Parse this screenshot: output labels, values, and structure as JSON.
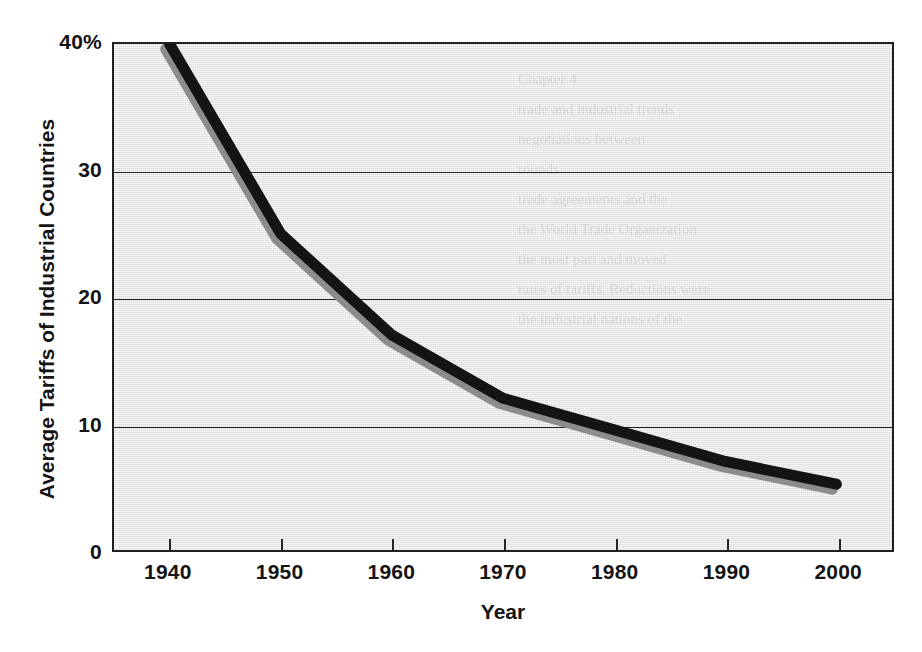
{
  "figure": {
    "background_color": "#ffffff",
    "plot_background_color": "#dcdcdc",
    "frame_color": "#1f1f1f"
  },
  "axis": {
    "x_title": "Year",
    "y_title": "Average Tariffs of Industrial Countries",
    "y_ticks": [
      "0",
      "10",
      "20",
      "30",
      "40%"
    ],
    "x_ticks": [
      "1940",
      "1950",
      "1960",
      "1970",
      "1980",
      "1990",
      "2000"
    ]
  },
  "ghost": {
    "line1": "Chapter 4",
    "line2": "trade and industrial trends",
    "line3": "negotiations between",
    "line4": "rounds",
    "line5": "trade agreements and the",
    "line6": "the World Trade Organization",
    "line7": "the most part and moved",
    "line8": "rates of tariffs. Reductions were",
    "line9": "the industrial nations of the"
  },
  "chart_data": {
    "type": "line",
    "title": "",
    "xlabel": "Year",
    "ylabel": "Average Tariffs of Industrial Countries",
    "x": [
      1940,
      1950,
      1960,
      1970,
      1980,
      1990,
      2000
    ],
    "values": [
      40,
      25,
      17,
      12,
      9.5,
      7,
      5.2
    ],
    "series": [
      {
        "name": "Average tariff rate",
        "values": [
          40,
          25,
          17,
          12,
          9.5,
          7,
          5.2
        ],
        "color": "#141414",
        "shadow_color": "#8c8c8c",
        "line_width": 11
      }
    ],
    "xlim": [
      1935,
      2005
    ],
    "ylim": [
      0,
      40
    ],
    "y_tick_values": [
      0,
      10,
      20,
      30,
      40
    ],
    "grid": "horizontal",
    "legend": "none",
    "units": "percent"
  }
}
